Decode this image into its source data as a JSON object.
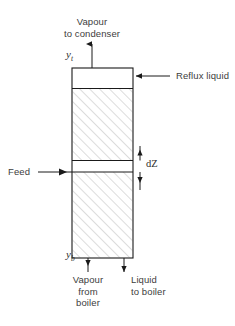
{
  "figure": {
    "type": "process-flow-diagram",
    "background_color": "#ffffff",
    "line_color": "#000000",
    "hatch_color": "#b9b9b9",
    "text_color": "#3d3d3d"
  },
  "column": {
    "name": "distillation-column",
    "x": 72,
    "y": 68,
    "width": 61,
    "height": 190,
    "border_color": "#000000",
    "sections": [
      {
        "name": "top-clear-band",
        "y": 68,
        "height": 20,
        "hatched": false
      },
      {
        "name": "rectifying-packed-section",
        "y": 88,
        "height": 72,
        "hatched": true
      },
      {
        "name": "differential-element-dZ",
        "y": 160,
        "height": 12,
        "hatched": false
      },
      {
        "name": "stripping-packed-section",
        "y": 172,
        "height": 86,
        "hatched": true
      }
    ]
  },
  "labels": {
    "vapour_to_condenser": {
      "line1": "Vapour",
      "line2": "to condenser"
    },
    "reflux_liquid": "Reflux liquid",
    "feed": "Feed",
    "dz": "dZ",
    "vapour_from_boiler": {
      "line1": "Vapour",
      "line2": "from",
      "line3": "boiler"
    },
    "liquid_to_boiler": {
      "line1": "Liquid",
      "line2": "to boiler"
    }
  },
  "variables": {
    "y_top": {
      "symbol": "y",
      "subscript": "t"
    },
    "y_bottom": {
      "symbol": "y",
      "subscript": "b"
    }
  },
  "arrows": [
    {
      "name": "vapour-out-top-arrow",
      "direction": "up",
      "at": "top of column"
    },
    {
      "name": "reflux-in-arrow",
      "direction": "left",
      "at": "top right of column"
    },
    {
      "name": "feed-in-arrow",
      "direction": "right",
      "at": "left at dZ level"
    },
    {
      "name": "dz-upper-arrow",
      "direction": "up",
      "at": "dZ upper bound"
    },
    {
      "name": "dz-lower-arrow",
      "direction": "down",
      "at": "dZ lower bound"
    },
    {
      "name": "vapour-out-bottom-arrow",
      "direction": "up",
      "at": "bottom left of column"
    },
    {
      "name": "liquid-out-bottom-arrow",
      "direction": "down",
      "at": "bottom right of column"
    }
  ]
}
